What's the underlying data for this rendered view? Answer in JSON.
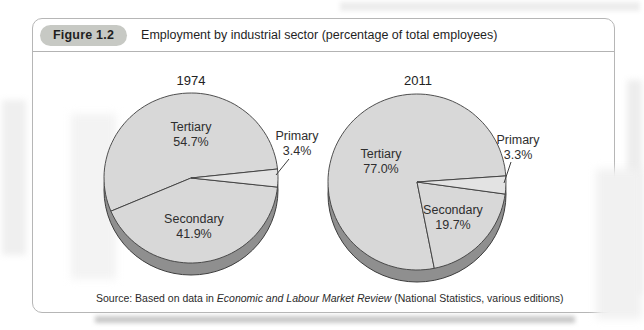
{
  "figure": {
    "badge": "Figure 1.2",
    "title": "Employment by industrial sector (percentage of total employees)",
    "source": {
      "prefix": "Source: Based on data in ",
      "italic": "Economic and Labour Market Review",
      "suffix": " (National Statistics, various editions)"
    }
  },
  "colors": {
    "pie_fill": "#d8d8d8",
    "primary_slice_fill": "#e3e3e3",
    "pie_rim": "#8f8f8f",
    "outline": "#3d3d3d",
    "badge_bg": "#c7c9c4",
    "box_border": "#b6b6b6",
    "text": "#1f1f1f"
  },
  "chart_data": [
    {
      "type": "pie",
      "style": "3d-pie",
      "title": "1974",
      "labels": [
        "Tertiary",
        "Secondary",
        "Primary"
      ],
      "values": [
        54.7,
        41.9,
        3.4
      ],
      "unit": "%",
      "slice_fills": [
        "#d8d8d8",
        "#d8d8d8",
        "#e3e3e3"
      ],
      "start_angle_deg": 6.1,
      "layout": {
        "cx": 130,
        "cy": 117,
        "rx": 87,
        "ry": 85,
        "depth": 12,
        "title_x": 130,
        "title_y": 24,
        "slice_labels": [
          {
            "x": 130,
            "y": 70
          },
          {
            "x": 133,
            "y": 162
          },
          {
            "x": 236,
            "y": 79,
            "leader": {
              "x1": 228,
              "y1": 98,
              "x2": 215,
              "y2": 114
            }
          }
        ]
      }
    },
    {
      "type": "pie",
      "style": "3d-pie",
      "title": "2011",
      "labels": [
        "Tertiary",
        "Secondary",
        "Primary"
      ],
      "values": [
        77.0,
        19.7,
        3.3
      ],
      "unit": "%",
      "slice_fills": [
        "#d8d8d8",
        "#d8d8d8",
        "#e3e3e3"
      ],
      "start_angle_deg": 4.0,
      "layout": {
        "cx": 130,
        "cy": 121,
        "rx": 89,
        "ry": 88,
        "depth": 12,
        "title_x": 131,
        "title_y": 24,
        "slice_labels": [
          {
            "x": 94,
            "y": 97
          },
          {
            "x": 166,
            "y": 153
          },
          {
            "x": 231,
            "y": 83,
            "leader": {
              "x1": 224,
              "y1": 101,
              "x2": 217,
              "y2": 122
            }
          }
        ]
      }
    }
  ]
}
